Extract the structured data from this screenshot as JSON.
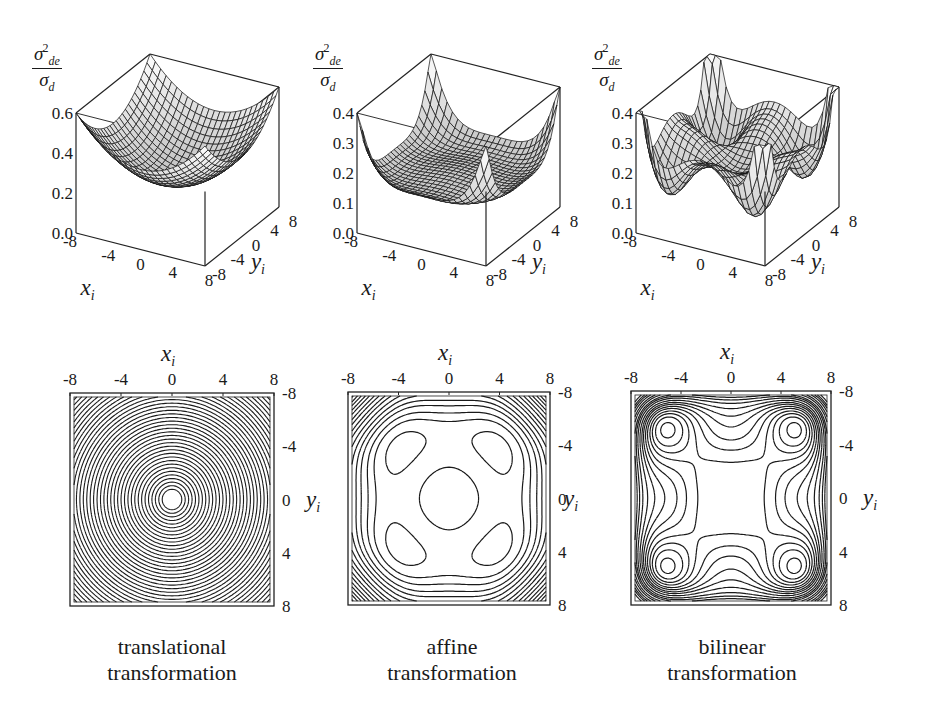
{
  "figure": {
    "captions": [
      {
        "line1": "translational",
        "line2": "transformation"
      },
      {
        "line1": "affine",
        "line2": "transformation"
      },
      {
        "line1": "bilinear",
        "line2": "transformation"
      }
    ],
    "z_label": {
      "num_base": "σ",
      "num_sup": "2",
      "num_sub": "de",
      "den_base": "σ",
      "den_sub": "d"
    },
    "x_label": {
      "base": "x",
      "sub": "i"
    },
    "y_label": {
      "base": "y",
      "sub": "i"
    }
  },
  "chart_data": [
    {
      "type": "surface3d",
      "title": "translational transformation (surface)",
      "xlabel": "x_i",
      "ylabel": "y_i",
      "zlabel": "σ²_de / σ_d",
      "x_ticks": [
        "-8",
        "-4",
        "0",
        "4",
        "8"
      ],
      "y_ticks": [
        "-8",
        "-4",
        "0",
        "4",
        "8"
      ],
      "z_ticks": [
        "0.0",
        "0.2",
        "0.4",
        "0.6"
      ],
      "xlim": [
        -8,
        8
      ],
      "ylim": [
        -8,
        8
      ],
      "zlim": [
        0,
        0.6
      ],
      "model": "paraboloid",
      "min_z": 0.2,
      "corner_z": 0.6,
      "edge_mid_z": 0.4
    },
    {
      "type": "surface3d",
      "title": "affine transformation (surface)",
      "xlabel": "x_i",
      "ylabel": "y_i",
      "zlabel": "σ²_de / σ_d",
      "x_ticks": [
        "-8",
        "-4",
        "0",
        "4",
        "8"
      ],
      "y_ticks": [
        "-8",
        "-4",
        "0",
        "4",
        "8"
      ],
      "z_ticks": [
        "0.0",
        "0.1",
        "0.2",
        "0.3",
        "0.4"
      ],
      "xlim": [
        -8,
        8
      ],
      "ylim": [
        -8,
        8
      ],
      "zlim": [
        0,
        0.4
      ],
      "model": "quartic",
      "center_z": 0.16,
      "min_z": 0.13,
      "corner_z": 0.4
    },
    {
      "type": "surface3d",
      "title": "bilinear transformation (surface)",
      "xlabel": "x_i",
      "ylabel": "y_i",
      "zlabel": "σ²_de / σ_d",
      "x_ticks": [
        "-8",
        "-4",
        "0",
        "4",
        "8"
      ],
      "y_ticks": [
        "-8",
        "-4",
        "0",
        "4",
        "8"
      ],
      "z_ticks": [
        "0.0",
        "0.1",
        "0.2",
        "0.3",
        "0.4"
      ],
      "xlim": [
        -8,
        8
      ],
      "ylim": [
        -8,
        8
      ],
      "zlim": [
        0,
        0.4
      ],
      "model": "four_wells",
      "minima_at": [
        [
          -5,
          -5
        ],
        [
          5,
          -5
        ],
        [
          -5,
          5
        ],
        [
          5,
          5
        ]
      ],
      "min_z": 0.12,
      "center_z": 0.2,
      "corner_z": 0.4
    },
    {
      "type": "contour",
      "title": "translational transformation",
      "xlabel": "x_i",
      "ylabel": "y_i",
      "x_ticks": [
        "-8",
        "-4",
        "0",
        "4",
        "8"
      ],
      "y_ticks": [
        "-8",
        "-4",
        "0",
        "4",
        "8"
      ],
      "xlim": [
        -8,
        8
      ],
      "ylim": [
        -8,
        8
      ],
      "pattern": "concentric circles centered at (0,0)",
      "levels": 40
    },
    {
      "type": "contour",
      "title": "affine transformation",
      "xlabel": "x_i",
      "ylabel": "y_i",
      "x_ticks": [
        "-8",
        "-4",
        "0",
        "4",
        "8"
      ],
      "y_ticks": [
        "-8",
        "-4",
        "0",
        "4",
        "8"
      ],
      "xlim": [
        -8,
        8
      ],
      "ylim": [
        -8,
        8
      ],
      "pattern": "central circles at (0,0), four diagonal lobes, dense rounded-square contours near edges"
    },
    {
      "type": "contour",
      "title": "bilinear transformation",
      "xlabel": "x_i",
      "ylabel": "y_i",
      "x_ticks": [
        "-8",
        "-4",
        "0",
        "4",
        "8"
      ],
      "y_ticks": [
        "-8",
        "-4",
        "0",
        "4",
        "8"
      ],
      "xlim": [
        -8,
        8
      ],
      "ylim": [
        -8,
        8
      ],
      "pattern": "five local extrema: center (0,0) and four at (±5,±5); dense contours at corners"
    }
  ]
}
